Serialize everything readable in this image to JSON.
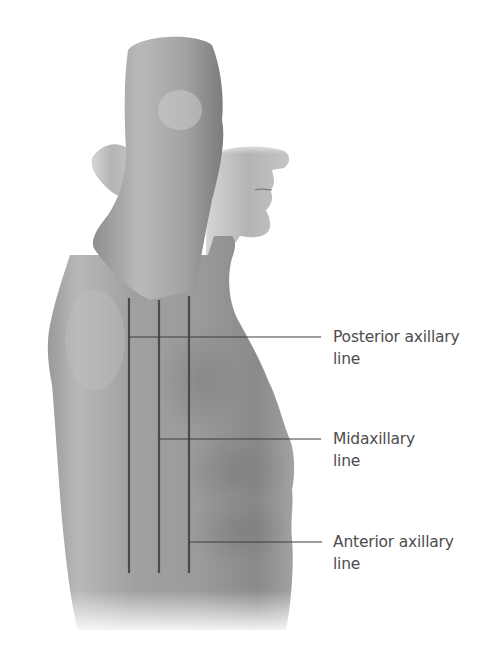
{
  "figure": {
    "colors": {
      "skin_light": "#c8c8c8",
      "skin_mid": "#9a9a9a",
      "skin_dark": "#6e6e6e",
      "line": "#4a4a4a",
      "leader": "#3c3c3c",
      "text": "#4d4d4d",
      "background": "#ffffff"
    },
    "vertical_lines": [
      {
        "name": "posterior-axillary-line",
        "x": 129,
        "y1": 298,
        "y2": 573
      },
      {
        "name": "midaxillary-line",
        "x": 159,
        "y1": 300,
        "y2": 573
      },
      {
        "name": "anterior-axillary-line",
        "x": 189,
        "y1": 296,
        "y2": 573
      }
    ]
  },
  "labels": [
    {
      "line1": "Posterior axillary",
      "line2": "line",
      "leader_y": 337,
      "leader_x1": 129,
      "leader_x2": 321,
      "text_top": 326
    },
    {
      "line1": "Midaxillary",
      "line2": "line",
      "leader_y": 439,
      "leader_x1": 159,
      "leader_x2": 321,
      "text_top": 428
    },
    {
      "line1": "Anterior axillary",
      "line2": "line",
      "leader_y": 542,
      "leader_x1": 189,
      "leader_x2": 322,
      "text_top": 531
    }
  ]
}
